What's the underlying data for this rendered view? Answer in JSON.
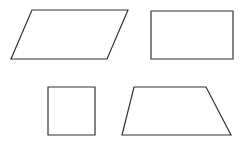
{
  "diagram": {
    "title": "",
    "stroke_color": "#333333",
    "stroke_width": 1.2,
    "background": "#ffffff",
    "shapes": [
      {
        "name": "parallelogram",
        "points": "32,10 128,10 107,59 11,59"
      },
      {
        "name": "rectangle",
        "points": "151,11 233,11 233,59 151,59"
      },
      {
        "name": "square",
        "points": "48,87 95,87 95,135 48,135"
      },
      {
        "name": "trapezoid",
        "points": "134,87 206,87 231,135 122,135"
      }
    ]
  }
}
